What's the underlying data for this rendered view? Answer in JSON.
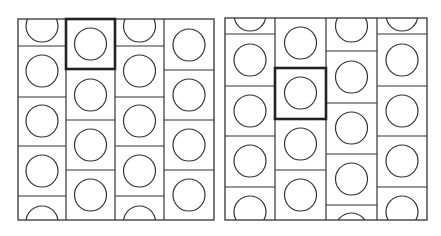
{
  "figure": {
    "line_color": "#333333",
    "highlight_color": "#222222",
    "panels": [
      {
        "name": "left-panel",
        "x0": 18,
        "y0": 19,
        "x1": 214,
        "y1": 220,
        "columns": [
          {
            "x0": 18,
            "x1": 66,
            "lines": [
              46,
              97,
              146,
              196
            ],
            "circles": [
              26,
              71,
              121,
              171,
              222
            ]
          },
          {
            "x0": 66,
            "x1": 115,
            "lines": [
              69,
              120,
              170
            ],
            "circles": [
              44,
              95,
              145,
              195
            ]
          },
          {
            "x0": 115,
            "x1": 164,
            "lines": [
              46,
              97,
              146,
              196
            ],
            "circles": [
              26,
              71,
              121,
              171,
              222
            ]
          },
          {
            "x0": 164,
            "x1": 214,
            "lines": [
              70,
              120,
              170
            ],
            "circles": [
              45,
              95,
              145,
              195
            ]
          }
        ],
        "highlight": {
          "x0": 66,
          "y0": 19,
          "x1": 115,
          "y1": 69
        }
      },
      {
        "name": "right-panel",
        "x0": 225,
        "y0": 18,
        "x1": 427,
        "y1": 220,
        "columns": [
          {
            "x0": 225,
            "x1": 275,
            "lines": [
              34,
              86,
              136,
              187
            ],
            "circles": [
              15,
              60,
              111,
              161,
              212
            ]
          },
          {
            "x0": 275,
            "x1": 326,
            "lines": [
              68,
              119,
              170
            ],
            "circles": [
              43,
              93,
              144,
              195
            ]
          },
          {
            "x0": 326,
            "x1": 377,
            "lines": [
              51,
              103,
              154,
              205
            ],
            "circles": [
              26,
              77,
              128,
              179,
              229
            ]
          },
          {
            "x0": 377,
            "x1": 427,
            "lines": [
              34,
              86,
              136,
              187
            ],
            "circles": [
              15,
              60,
              111,
              161,
              212
            ]
          }
        ],
        "highlight": {
          "x0": 275,
          "y0": 68,
          "x1": 326,
          "y1": 119
        }
      }
    ],
    "circle_radius": 16
  }
}
